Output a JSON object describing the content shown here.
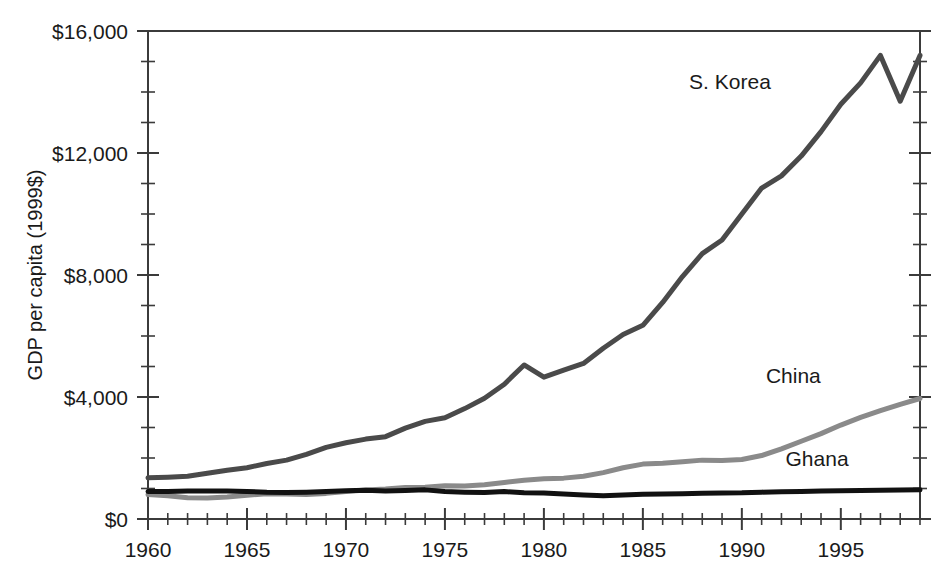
{
  "chart_data": {
    "type": "line",
    "title": "",
    "xlabel": "",
    "ylabel": "GDP per capita (1999$)",
    "xlim": [
      1960,
      1999
    ],
    "ylim": [
      0,
      16000
    ],
    "grid": false,
    "legend_position": "inline-labels",
    "y_ticks_major": [
      0,
      4000,
      8000,
      12000,
      16000
    ],
    "y_tick_labels": [
      "$0",
      "$4,000",
      "$8,000",
      "$12,000",
      "$16,000"
    ],
    "y_tick_minor_step": 1000,
    "x_ticks_major": [
      1960,
      1965,
      1970,
      1975,
      1980,
      1985,
      1990,
      1995
    ],
    "x_tick_labels": [
      "1960",
      "1965",
      "1970",
      "1975",
      "1980",
      "1985",
      "1990",
      "1995"
    ],
    "x_tick_minor_step": 1,
    "x": [
      1960,
      1961,
      1962,
      1963,
      1964,
      1965,
      1966,
      1967,
      1968,
      1969,
      1970,
      1971,
      1972,
      1973,
      1974,
      1975,
      1976,
      1977,
      1978,
      1979,
      1980,
      1981,
      1982,
      1983,
      1984,
      1985,
      1986,
      1987,
      1988,
      1989,
      1990,
      1991,
      1992,
      1993,
      1994,
      1995,
      1996,
      1997,
      1998,
      1999
    ],
    "series": [
      {
        "name": "S. Korea",
        "color": "#4a4a4a",
        "width": 5,
        "label_x": 1989.4,
        "label_y": 14100,
        "values": [
          1350,
          1370,
          1400,
          1500,
          1600,
          1680,
          1820,
          1930,
          2120,
          2350,
          2500,
          2620,
          2700,
          2980,
          3200,
          3320,
          3620,
          3960,
          4420,
          5050,
          4650,
          4880,
          5100,
          5600,
          6050,
          6350,
          7100,
          7950,
          8700,
          9150,
          10000,
          10850,
          11250,
          11900,
          12700,
          13600,
          14300,
          15200,
          13700,
          15200
        ]
      },
      {
        "name": "China",
        "color": "#8a8a8a",
        "width": 5,
        "label_x": 1992.6,
        "label_y": 4450,
        "values": [
          800,
          760,
          700,
          690,
          720,
          780,
          830,
          820,
          800,
          840,
          900,
          950,
          980,
          1030,
          1040,
          1090,
          1080,
          1120,
          1200,
          1270,
          1320,
          1340,
          1400,
          1520,
          1680,
          1800,
          1830,
          1880,
          1930,
          1920,
          1950,
          2080,
          2300,
          2550,
          2800,
          3080,
          3330,
          3550,
          3760,
          3950
        ]
      },
      {
        "name": "Ghana",
        "color": "#111111",
        "width": 5,
        "label_x": 1993.8,
        "label_y": 1750,
        "values": [
          900,
          905,
          915,
          920,
          915,
          905,
          875,
          865,
          880,
          900,
          930,
          940,
          920,
          935,
          955,
          905,
          880,
          865,
          900,
          860,
          850,
          820,
          790,
          760,
          790,
          810,
          820,
          830,
          845,
          855,
          860,
          880,
          890,
          905,
          915,
          925,
          935,
          945,
          950,
          955
        ]
      }
    ]
  }
}
